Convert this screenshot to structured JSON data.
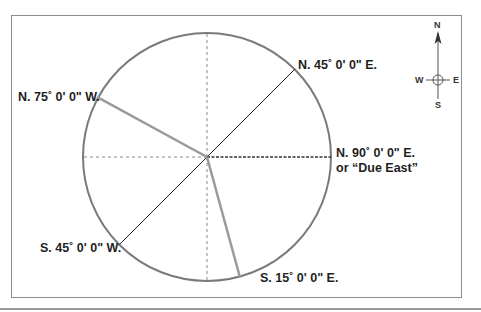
{
  "figure": {
    "title_fragment": "",
    "circle": {
      "cx": 207,
      "cy": 157,
      "r": 125,
      "stroke": "#7a7a7a"
    },
    "bearings": [
      {
        "id": "n45e",
        "label": "N. 45˚ 0' 0\" E.",
        "azimuth_deg": 45,
        "style": "thin-black"
      },
      {
        "id": "n75w",
        "label": "N. 75˚ 0' 0\" W.",
        "azimuth_deg": 285,
        "style": "thick-gray"
      },
      {
        "id": "n90e",
        "label": "N. 90˚ 0' 0\" E.",
        "label_line2": "or “Due East”",
        "azimuth_deg": 90,
        "style": "dashed-black"
      },
      {
        "id": "s45w",
        "label": "S. 45˚ 0' 0\" W.",
        "azimuth_deg": 225,
        "style": "thin-black"
      },
      {
        "id": "s15e",
        "label": "S. 15˚ 0' 0\" E.",
        "azimuth_deg": 165,
        "style": "thick-gray"
      }
    ],
    "reference_axes": {
      "style": "dotted-light-gray",
      "directions": [
        "north",
        "south",
        "west"
      ]
    },
    "colors": {
      "frame": "#8c8c8c",
      "thin_line": "#222222",
      "thick_gray": "#9a9a9a",
      "dotted": "#c4c4c4",
      "text": "#1f1f1f"
    }
  },
  "compass": {
    "north": "N",
    "south": "S",
    "east": "E",
    "west": "W"
  }
}
